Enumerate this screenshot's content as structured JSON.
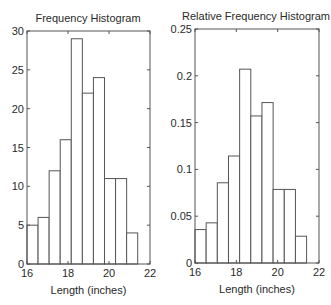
{
  "chart_data": [
    {
      "type": "bar",
      "title": "Frequency Histogram",
      "xlabel": "Length (inches)",
      "ylabel": "",
      "bin_edges": [
        16.0,
        16.54,
        17.08,
        17.62,
        18.16,
        18.7,
        19.24,
        19.78,
        20.32,
        20.86,
        21.4
      ],
      "values": [
        5,
        6,
        12,
        16,
        29,
        22,
        24,
        11,
        11,
        4
      ],
      "xlim": [
        16,
        22
      ],
      "ylim": [
        0,
        30
      ],
      "xticks": [
        16,
        18,
        20,
        22
      ],
      "xtick_labels": [
        "16",
        "18",
        "20",
        "22"
      ],
      "yticks": [
        0,
        5,
        10,
        15,
        20,
        25,
        30
      ],
      "ytick_labels": [
        "0",
        "5",
        "10",
        "15",
        "20",
        "25",
        "30"
      ],
      "grid": false,
      "legend": null
    },
    {
      "type": "bar",
      "title": "Relative Frequency Histogram",
      "xlabel": "Length (inches)",
      "ylabel": "",
      "bin_edges": [
        16.0,
        16.54,
        17.08,
        17.62,
        18.16,
        18.7,
        19.24,
        19.78,
        20.32,
        20.86,
        21.4
      ],
      "values": [
        0.0357,
        0.0429,
        0.0857,
        0.1143,
        0.2071,
        0.1571,
        0.1714,
        0.0786,
        0.0786,
        0.0286
      ],
      "xlim": [
        16,
        22
      ],
      "ylim": [
        0,
        0.25
      ],
      "xticks": [
        16,
        18,
        20,
        22
      ],
      "xtick_labels": [
        "16",
        "18",
        "20",
        "22"
      ],
      "yticks": [
        0,
        0.05,
        0.1,
        0.15,
        0.2,
        0.25
      ],
      "ytick_labels": [
        "0",
        "0.05",
        "0.1",
        "0.15",
        "0.2",
        "0.25"
      ],
      "grid": false,
      "legend": null
    }
  ],
  "layout": [
    {
      "left": 27,
      "right": 150,
      "top": 31,
      "bottom": 264,
      "title_x": 88,
      "title_y": 22,
      "xlabel_y": 294
    },
    {
      "left": 195,
      "right": 319,
      "top": 29,
      "bottom": 263,
      "title_x": 256,
      "title_y": 20,
      "xlabel_y": 293
    }
  ],
  "colors": {
    "axis": "#555555",
    "bar_edge": "#555555",
    "bar_fill": "#ffffff",
    "text": "#2a2a2a"
  }
}
